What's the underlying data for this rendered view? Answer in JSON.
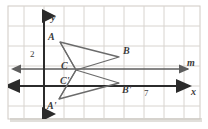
{
  "figure": {
    "type": "coordinate-geometry-diagram",
    "background_color": "#ffffff",
    "grid_color": "#d8d4cf",
    "axis_color": "#2b2b2b",
    "line_m_color": "#5e5e5e",
    "shape_color": "#6b6b6b",
    "label_color": "#3b3b3b",
    "panel": {
      "x": 8,
      "y": 6,
      "width": 192,
      "height": 113
    },
    "grid": {
      "spacing": 20,
      "origin_x": 44,
      "origin_y": 86
    },
    "axes": [
      {
        "name": "y-axis",
        "label": "y",
        "label_x": 51,
        "label_y": 20,
        "orientation": "vertical"
      },
      {
        "name": "x-axis",
        "label": "x",
        "label_x": 192,
        "label_y": 95,
        "orientation": "horizontal"
      }
    ],
    "lines": [
      {
        "name": "line-m",
        "label": "m",
        "label_x": 189,
        "label_y": 65,
        "y": 69
      }
    ],
    "tick_labels": [
      {
        "name": "tick-2",
        "text": "2",
        "x": 31,
        "y": 56
      },
      {
        "name": "tick-7",
        "text": "7",
        "x": 146,
        "y": 95
      }
    ],
    "triangles": [
      {
        "name": "triangle-abc",
        "vertices": [
          {
            "label": "A",
            "x": 60,
            "y": 42,
            "label_x": 49,
            "label_y": 39
          },
          {
            "label": "B",
            "x": 119,
            "y": 57,
            "label_x": 123,
            "label_y": 53
          },
          {
            "label": "C",
            "x": 76,
            "y": 70,
            "label_x": 62,
            "label_y": 68
          }
        ]
      },
      {
        "name": "triangle-a-prime-b-prime-c-prime",
        "vertices": [
          {
            "label": "A'",
            "x": 59,
            "y": 99,
            "label_x": 49,
            "label_y": 107
          },
          {
            "label": "B'",
            "x": 119,
            "y": 83,
            "label_x": 123,
            "label_y": 92
          },
          {
            "label": "C'",
            "x": 76,
            "y": 70,
            "label_x": 62,
            "label_y": 83
          }
        ]
      }
    ]
  }
}
